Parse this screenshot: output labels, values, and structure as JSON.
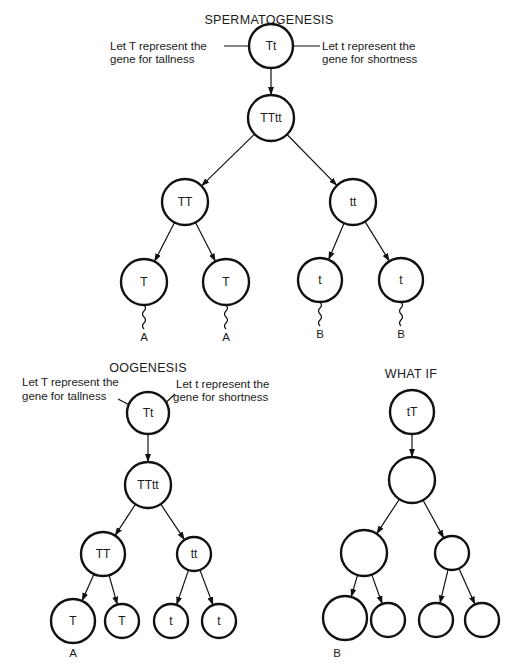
{
  "figure": {
    "panels": [
      {
        "id": "spermatogenesis",
        "title": "SPERMATOGENESIS",
        "notes": {
          "left": [
            "Let T represent the",
            "gene for tallness"
          ],
          "right": [
            "Let t represent the",
            "gene for shortness"
          ]
        },
        "nodes": [
          {
            "id": "s0",
            "label": "Tt"
          },
          {
            "id": "s1",
            "label": "TTtt"
          },
          {
            "id": "s2",
            "label": "TT"
          },
          {
            "id": "s3",
            "label": "tt"
          },
          {
            "id": "s4",
            "label": "T",
            "tail_label": "A"
          },
          {
            "id": "s5",
            "label": "T",
            "tail_label": "A"
          },
          {
            "id": "s6",
            "label": "t",
            "tail_label": "B"
          },
          {
            "id": "s7",
            "label": "t",
            "tail_label": "B"
          }
        ],
        "edges": [
          [
            "s0",
            "s1"
          ],
          [
            "s1",
            "s2"
          ],
          [
            "s1",
            "s3"
          ],
          [
            "s2",
            "s4"
          ],
          [
            "s2",
            "s5"
          ],
          [
            "s3",
            "s6"
          ],
          [
            "s3",
            "s7"
          ]
        ]
      },
      {
        "id": "oogenesis",
        "title": "OOGENESIS",
        "notes": {
          "left": [
            "Let T represent the",
            "gene for tallness"
          ],
          "right": [
            "Let t represent the",
            "gene for shortness"
          ]
        },
        "nodes": [
          {
            "id": "o0",
            "label": "Tt"
          },
          {
            "id": "o1",
            "label": "TTtt"
          },
          {
            "id": "o2",
            "label": "TT"
          },
          {
            "id": "o3",
            "label": "tt"
          },
          {
            "id": "o4",
            "label": "T"
          },
          {
            "id": "o5",
            "label": "T"
          },
          {
            "id": "o6",
            "label": "t"
          },
          {
            "id": "o7",
            "label": "t"
          }
        ],
        "edges": [
          [
            "o0",
            "o1"
          ],
          [
            "o1",
            "o2"
          ],
          [
            "o1",
            "o3"
          ],
          [
            "o2",
            "o4"
          ],
          [
            "o2",
            "o5"
          ],
          [
            "o3",
            "o6"
          ],
          [
            "o3",
            "o7"
          ]
        ],
        "panel_label": "A"
      },
      {
        "id": "what-if",
        "title": "WHAT IF",
        "nodes": [
          {
            "id": "w0",
            "label": "tT"
          },
          {
            "id": "w1",
            "label": ""
          },
          {
            "id": "w2",
            "label": ""
          },
          {
            "id": "w3",
            "label": ""
          },
          {
            "id": "w4",
            "label": ""
          },
          {
            "id": "w5",
            "label": ""
          },
          {
            "id": "w6",
            "label": ""
          },
          {
            "id": "w7",
            "label": ""
          }
        ],
        "edges": [
          [
            "w0",
            "w1"
          ],
          [
            "w1",
            "w2"
          ],
          [
            "w1",
            "w3"
          ],
          [
            "w2",
            "w4"
          ],
          [
            "w2",
            "w5"
          ],
          [
            "w3",
            "w6"
          ],
          [
            "w3",
            "w7"
          ]
        ],
        "panel_label": "B"
      }
    ]
  }
}
